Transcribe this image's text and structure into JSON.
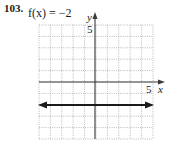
{
  "problem": {
    "number": "103.",
    "function_label": "f(x) = −2"
  },
  "axes": {
    "x_label": "x",
    "y_label": "y",
    "x_tick_label": "5",
    "y_tick_label": "5"
  },
  "colors": {
    "grid": "#a8a8a8",
    "axis": "#3a3a3a",
    "line": "#1a1a1a"
  },
  "chart_data": {
    "type": "line",
    "title": "f(x) = −2",
    "xlabel": "x",
    "ylabel": "y",
    "xlim": [
      -5,
      5
    ],
    "ylim": [
      -5,
      5
    ],
    "grid": true,
    "grid_step": 1,
    "tick_labels": {
      "x": [
        "5"
      ],
      "y": [
        "5"
      ]
    },
    "series": [
      {
        "name": "f(x) = -2",
        "x": [
          -5,
          5
        ],
        "y": [
          -2,
          -2
        ],
        "arrows": "both"
      }
    ]
  }
}
